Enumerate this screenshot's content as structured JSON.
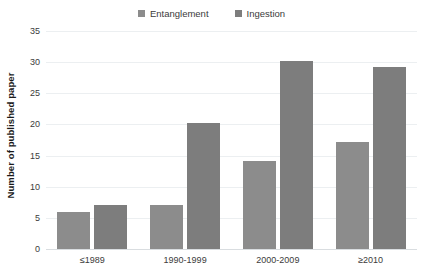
{
  "chart_data": {
    "type": "bar",
    "title": "",
    "xlabel": "",
    "ylabel": "Number of published paper",
    "categories": [
      "≤1989",
      "1990-1999",
      "2000-2009",
      "≥2010"
    ],
    "series": [
      {
        "name": "Entanglement",
        "color": "#8c8c8c",
        "values": [
          6,
          7,
          14.2,
          17.2
        ]
      },
      {
        "name": "Ingestion",
        "color": "#7d7d7d",
        "values": [
          7,
          20.2,
          30.2,
          29.2
        ]
      }
    ],
    "ylim": [
      0,
      35
    ],
    "yticks": [
      0,
      5,
      10,
      15,
      20,
      25,
      30,
      35
    ],
    "ytick_labels": [
      "0",
      "5",
      "10",
      "15",
      "20",
      "25",
      "30",
      "35"
    ],
    "grid": true,
    "legend_position": "top-center"
  },
  "legend": {
    "items": [
      {
        "label": "Entanglement",
        "swatch": "legend-swatch-entanglement"
      },
      {
        "label": "Ingestion",
        "swatch": "legend-swatch-ingestion"
      }
    ]
  },
  "colors": {
    "entanglement": "#8c8c8c",
    "ingestion": "#7d7d7d",
    "gridline": "#eceff1",
    "axis": "#d9dde0",
    "text": "#3b3b3b",
    "title_text": "#1a1a1a",
    "background": "#ffffff"
  }
}
